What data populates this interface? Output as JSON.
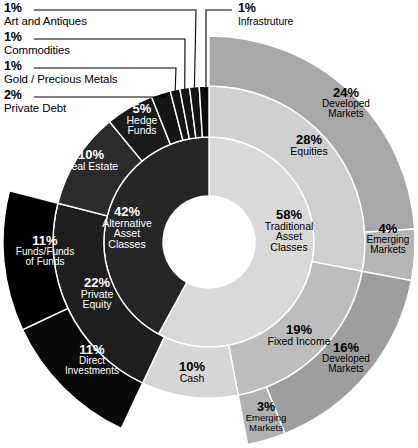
{
  "chart_data": {
    "type": "pie",
    "title": "",
    "subtitle": "",
    "xlabel": "",
    "ylabel": "",
    "legend_position": "none",
    "grid": false,
    "variant": "sunburst-donut",
    "start_angle_deg": 0,
    "direction": "clockwise",
    "units": "percent",
    "rings": [
      {
        "level": 1,
        "name": "Asset Class Type",
        "categories": [
          "Traditional Asset Classes",
          "Alternative Asset Classes"
        ],
        "values": [
          58,
          42
        ],
        "colors": [
          "#d9d9d9",
          "#262626"
        ]
      },
      {
        "level": 2,
        "name": "Asset Class",
        "categories": [
          "Equities",
          "Fixed Income",
          "Cash",
          "Private Equity",
          "Real Estate",
          "Hedge Funds",
          "Private Debt",
          "Gold / Precious Metals",
          "Commodities",
          "Art and Antiques",
          "Infrastruture"
        ],
        "values": [
          28,
          19,
          10,
          22,
          10,
          5,
          2,
          1,
          1,
          1,
          1
        ],
        "colors": [
          "#cfcfcf",
          "#bdbdbd",
          "#d6d6d6",
          "#1c1c1c",
          "#2b2b2b",
          "#1a1a1a",
          "#111111",
          "#111111",
          "#111111",
          "#111111",
          "#0d0d0d"
        ]
      },
      {
        "level": 3,
        "name": "Sub Allocation",
        "categories": [
          "Developed Markets (Equities)",
          "Emerging Markets (Equities)",
          "Developed Markets (Fixed Income)",
          "Emerging Markets (Fixed Income)",
          "Direct Investments",
          "Funds/Funds of Funds"
        ],
        "values": [
          24,
          4,
          16,
          3,
          11,
          11
        ],
        "colors": [
          "#a8a8a8",
          "#b5b5b5",
          "#9e9e9e",
          "#b0b0b0",
          "#0a0a0a",
          "#000000"
        ]
      }
    ],
    "segments": [
      {
        "id": "traditional",
        "label": "Traditional Asset Classes",
        "value": 58,
        "display": "58%",
        "ring": 1
      },
      {
        "id": "alternative",
        "label": "Alternative Asset Classes",
        "value": 42,
        "display": "42%",
        "ring": 1
      },
      {
        "id": "equities",
        "label": "Equities",
        "value": 28,
        "display": "28%",
        "ring": 2,
        "parent": "traditional"
      },
      {
        "id": "fixed-income",
        "label": "Fixed Income",
        "value": 19,
        "display": "19%",
        "ring": 2,
        "parent": "traditional"
      },
      {
        "id": "cash",
        "label": "Cash",
        "value": 10,
        "display": "10%",
        "ring": 2,
        "parent": "traditional"
      },
      {
        "id": "private-equity",
        "label": "Private Equity",
        "value": 22,
        "display": "22%",
        "ring": 2,
        "parent": "alternative"
      },
      {
        "id": "real-estate",
        "label": "Real Estate",
        "value": 10,
        "display": "10%",
        "ring": 2,
        "parent": "alternative"
      },
      {
        "id": "hedge-funds",
        "label": "Hedge Funds",
        "value": 5,
        "display": "5%",
        "ring": 2,
        "parent": "alternative"
      },
      {
        "id": "private-debt",
        "label": "Private Debt",
        "value": 2,
        "display": "2%",
        "ring": 2,
        "parent": "alternative"
      },
      {
        "id": "gold",
        "label": "Gold / Precious Metals",
        "value": 1,
        "display": "1%",
        "ring": 2,
        "parent": "alternative"
      },
      {
        "id": "commodities",
        "label": "Commodities",
        "value": 1,
        "display": "1%",
        "ring": 2,
        "parent": "alternative"
      },
      {
        "id": "art",
        "label": "Art and Antiques",
        "value": 1,
        "display": "1%",
        "ring": 2,
        "parent": "alternative"
      },
      {
        "id": "infrastructure",
        "label": "Infrastruture",
        "value": 1,
        "display": "1%",
        "ring": 2,
        "parent": "alternative"
      },
      {
        "id": "eq-developed",
        "label": "Developed Markets",
        "value": 24,
        "display": "24%",
        "ring": 3,
        "parent": "equities"
      },
      {
        "id": "eq-emerging",
        "label": "Emerging Markets",
        "value": 4,
        "display": "4%",
        "ring": 3,
        "parent": "equities"
      },
      {
        "id": "fi-developed",
        "label": "Developed Markets",
        "value": 16,
        "display": "16%",
        "ring": 3,
        "parent": "fixed-income"
      },
      {
        "id": "fi-emerging",
        "label": "Emerging Markets",
        "value": 3,
        "display": "3%",
        "ring": 3,
        "parent": "fixed-income"
      },
      {
        "id": "direct-investments",
        "label": "Direct Investments",
        "value": 11,
        "display": "11%",
        "ring": 3,
        "parent": "private-equity"
      },
      {
        "id": "funds-of-funds",
        "label": "Funds/Funds of Funds",
        "value": 11,
        "display": "11%",
        "ring": 3,
        "parent": "private-equity"
      }
    ]
  },
  "callouts": [
    {
      "id": "art",
      "pct": "1%",
      "name": "Art and Antiques"
    },
    {
      "id": "commodities",
      "pct": "1%",
      "name": "Commodities"
    },
    {
      "id": "gold",
      "pct": "1%",
      "name": "Gold / Precious Metals"
    },
    {
      "id": "private-debt",
      "pct": "2%",
      "name": "Private Debt"
    },
    {
      "id": "infrastructure",
      "pct": "1%",
      "name": "Infrastruture"
    }
  ],
  "inner_labels": {
    "traditional": {
      "pct": "58%",
      "line1": "Traditional",
      "line2": "Asset",
      "line3": "Classes"
    },
    "alternative": {
      "pct": "42%",
      "line1": "Alternative",
      "line2": "Asset",
      "line3": "Classes"
    }
  },
  "mid_labels": {
    "equities": {
      "pct": "28%",
      "name": "Equities"
    },
    "fixed_income": {
      "pct": "19%",
      "name": "Fixed Income"
    },
    "cash": {
      "pct": "10%",
      "name": "Cash"
    },
    "private_equity": {
      "pct": "22%",
      "line1": "Private",
      "line2": "Equity"
    },
    "real_estate": {
      "pct": "10%",
      "name": "Real Estate"
    },
    "hedge_funds": {
      "pct": "5%",
      "line1": "Hedge",
      "line2": "Funds"
    }
  },
  "outer_labels": {
    "eq_developed": {
      "pct": "24%",
      "line1": "Developed",
      "line2": "Markets"
    },
    "eq_emerging": {
      "pct": "4%",
      "line1": "Emerging",
      "line2": "Markets"
    },
    "fi_developed": {
      "pct": "16%",
      "line1": "Developed",
      "line2": "Markets"
    },
    "fi_emerging": {
      "pct": "3%",
      "line1": "Emerging",
      "line2": "Markets"
    },
    "direct_investments": {
      "pct": "11%",
      "line1": "Direct",
      "line2": "Investments"
    },
    "funds_of_funds": {
      "pct": "11%",
      "line1": "Funds/Funds",
      "line2": "of Funds"
    }
  },
  "colors": {
    "traditional": "#d9d9d9",
    "alternative": "#262626",
    "equities": "#cfcfcf",
    "fixed_income": "#bdbdbd",
    "cash": "#d6d6d6",
    "alt_mid": "#1e1e1e",
    "eq_developed": "#a8a8a8",
    "eq_emerging": "#b5b5b5",
    "fi_developed": "#9e9e9e",
    "fi_emerging": "#b0b0b0",
    "direct": "#0a0a0a",
    "fof": "#000000",
    "background": "#ffffff",
    "stroke": "#ffffff",
    "leader": "#000000"
  }
}
